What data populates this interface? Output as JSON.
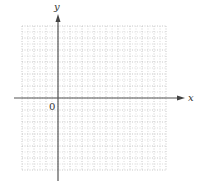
{
  "diagram": {
    "type": "cartesian-coordinate-grid",
    "x_axis_label": "x",
    "y_axis_label": "y",
    "origin_label": "0",
    "grid": {
      "columns": 12,
      "rows": 12,
      "cell_size_px": 12,
      "left": 22,
      "top": 26,
      "origin_col": 3,
      "origin_row": 6,
      "line_style": "dotted",
      "line_color": "#bbbbbb"
    },
    "axis_color": "#555555"
  }
}
